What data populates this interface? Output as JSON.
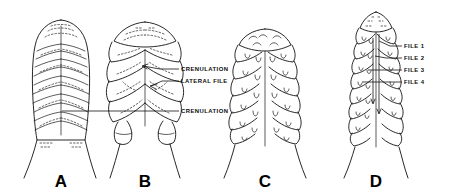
{
  "figure": {
    "background_color": "#ffffff",
    "ink_color": "#111111",
    "width": 455,
    "height": 194,
    "style": "line-drawing"
  },
  "panels": [
    {
      "id": "A",
      "caption": "A",
      "description": "Elongate oval blade with chevron-patterned internal rows and a smooth, barely crenulate margin",
      "caption_x": 61,
      "caption_y": 187
    },
    {
      "id": "B",
      "caption": "B",
      "description": "Broadly ovate blade with strongly scalloped lobes and a V-shaped median groove",
      "caption_x": 145,
      "caption_y": 187
    },
    {
      "id": "C",
      "caption": "C",
      "description": "Narrow blade with deeply incised lobed margin and paired U-shaped crenulation marks",
      "caption_x": 265,
      "caption_y": 187
    },
    {
      "id": "D",
      "caption": "D",
      "description": "Slender acuminate blade showing four longitudinal files of marginal lobes",
      "caption_x": 376,
      "caption_y": 187
    }
  ],
  "annotations": [
    {
      "key": "crenulation-upper",
      "label": "CRENULATION",
      "text_x": 181,
      "text_y": 71,
      "leader_from_x": 179,
      "leader_from_y": 69,
      "leader_to_x": 143,
      "leader_to_y": 66,
      "has_arrowhead": true,
      "target_panel": "B"
    },
    {
      "key": "lateral-file",
      "label": "LATERAL FILE",
      "text_x": 181,
      "text_y": 83,
      "leader_from_x": 179,
      "leader_from_y": 81,
      "leader_to_x": 151,
      "leader_to_y": 86,
      "has_arrowhead": true,
      "target_panel": "B"
    },
    {
      "key": "crenulation-lower",
      "label": "CRENULATION",
      "text_x": 181,
      "text_y": 113,
      "leader_from_x": 179,
      "leader_from_y": 111,
      "leader_to_x": 62,
      "leader_to_y": 111,
      "has_arrowhead": false,
      "target_panel": "A"
    },
    {
      "key": "file-1",
      "label": "FILE 1",
      "text_x": 404,
      "text_y": 48,
      "leader_from_x": 402,
      "leader_from_y": 46,
      "leader_to_x": 379,
      "leader_to_y": 41,
      "has_arrowhead": false,
      "target_panel": "D"
    },
    {
      "key": "file-2",
      "label": "FILE 2",
      "text_x": 404,
      "text_y": 60,
      "leader_from_x": 402,
      "leader_from_y": 58,
      "leader_to_x": 375,
      "leader_to_y": 56,
      "has_arrowhead": false,
      "target_panel": "D"
    },
    {
      "key": "file-3",
      "label": "FILE 3",
      "text_x": 404,
      "text_y": 72,
      "leader_from_x": 402,
      "leader_from_y": 70,
      "leader_to_x": 368,
      "leader_to_y": 70,
      "has_arrowhead": false,
      "target_panel": "D"
    },
    {
      "key": "file-4",
      "label": "FILE 4",
      "text_x": 404,
      "text_y": 84,
      "leader_from_x": 402,
      "leader_from_y": 82,
      "leader_to_x": 362,
      "leader_to_y": 82,
      "has_arrowhead": false,
      "target_panel": "D"
    }
  ]
}
